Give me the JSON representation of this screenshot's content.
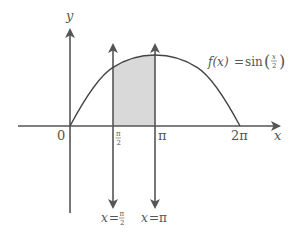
{
  "diagram": {
    "function_label": {
      "lhs": "f(x)",
      "eq": "=",
      "rhs_fn": "sin",
      "frac_num": "x",
      "frac_den": "2"
    },
    "axes": {
      "x_label": "x",
      "y_label": "y",
      "origin_label": "0"
    },
    "x_ticks": {
      "half_pi_num": "π",
      "half_pi_den": "2",
      "pi": "π",
      "two_pi": "2π"
    },
    "vertical_lines": [
      {
        "lhs": "x",
        "eq": "=",
        "num": "π",
        "den": "2"
      },
      {
        "lhs": "x",
        "eq": "=",
        "value": "π"
      }
    ],
    "shaded_region": {
      "from": "π/2",
      "to": "π",
      "fill": "#d9d9d9"
    },
    "colors": {
      "axis": "#555555",
      "curve": "#444444",
      "shade": "#d9d9d9",
      "text": "#555555"
    }
  }
}
